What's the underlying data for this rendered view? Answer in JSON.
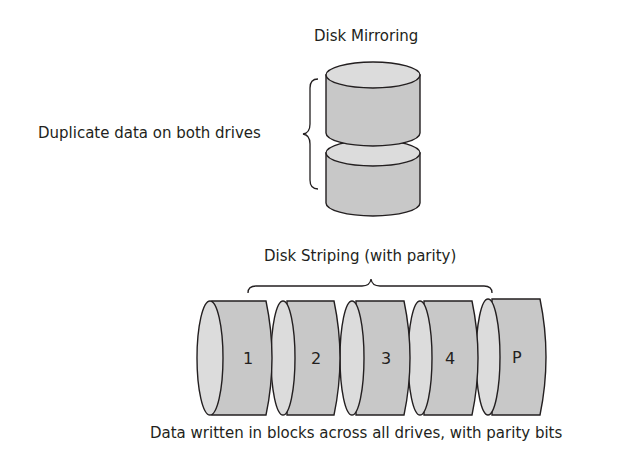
{
  "mirroring": {
    "title": "Disk Mirroring",
    "caption": "Duplicate data on both drives"
  },
  "striping": {
    "title": "Disk Striping (with parity)",
    "caption": "Data written in blocks across all drives, with parity bits",
    "drives": [
      {
        "label": "1"
      },
      {
        "label": "2"
      },
      {
        "label": "3"
      },
      {
        "label": "4"
      },
      {
        "label": "P"
      }
    ]
  },
  "colors": {
    "fill": "#c8c8c8",
    "face": "#dcdcdc",
    "stroke": "#231f20"
  }
}
